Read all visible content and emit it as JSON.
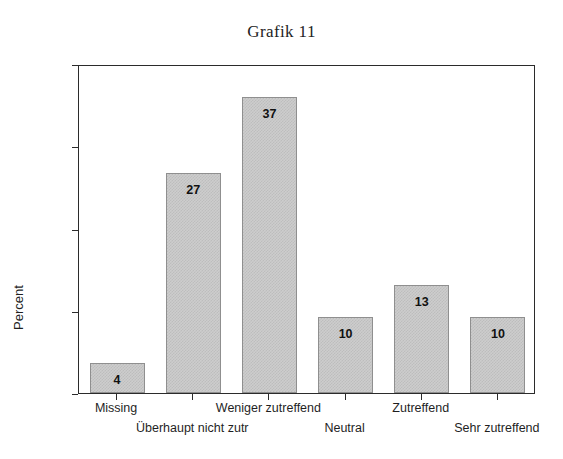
{
  "chart_data": {
    "type": "bar",
    "title": "Grafik 11",
    "xlabel": "",
    "ylabel": "Percent",
    "categories": [
      "Missing",
      "Überhaupt nicht zutr",
      "Weniger zutreffend",
      "Neutral",
      "Zutreffend",
      "Sehr zutreffend"
    ],
    "values": [
      3.6,
      26.7,
      36.0,
      9.2,
      13.1,
      9.2
    ],
    "data_labels": [
      "4",
      "27",
      "37",
      "10",
      "13",
      "10"
    ],
    "ylim": [
      0,
      40
    ],
    "yticks": [
      0,
      10,
      20,
      30,
      40
    ],
    "ytick_labels": [
      "0",
      "10",
      "20",
      "30",
      "40"
    ],
    "grid": false,
    "legend": null,
    "bar_fill_color": "#cdcdcd",
    "bar_edge_color": "#8f8f8f",
    "axis_color": "#2b2b2b"
  },
  "axis": {
    "y_title": "Percent"
  }
}
